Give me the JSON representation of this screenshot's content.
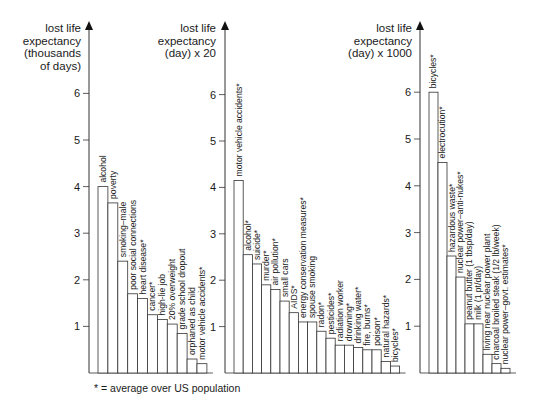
{
  "footnote": "* = average over US population",
  "chart_data": [
    {
      "type": "bar",
      "title": "",
      "ylabel": [
        "lost life",
        "expectancy",
        "(thousands",
        "of days)"
      ],
      "yticks": [
        1,
        2,
        3,
        4,
        5,
        6
      ],
      "ylim": [
        0,
        7
      ],
      "grid": false,
      "categories": [
        "alcohol",
        "poverty",
        "smoking–male",
        "poor social connections",
        "heart disease*",
        "cancer*",
        "high-lie job",
        "20% overweight",
        "grade school dropout",
        "orphaned as child",
        "motor vehicle accidents*"
      ],
      "values": [
        4.0,
        3.65,
        2.4,
        1.7,
        1.6,
        1.25,
        1.15,
        1.05,
        0.85,
        0.3,
        0.2
      ]
    },
    {
      "type": "bar",
      "title": "",
      "ylabel": [
        "lost life",
        "expectancy",
        "(day) x 20"
      ],
      "yticks": [
        1,
        2,
        3,
        4,
        5,
        6
      ],
      "ylim": [
        0,
        7
      ],
      "grid": false,
      "categories": [
        "motor vehicle accidents*",
        "alcohol*",
        "suicide*",
        "murder*",
        "air pollution*",
        "small cars",
        "AIDS*",
        "energy conservation measures*",
        "spouse smoking",
        "radon*",
        "pesticides*",
        "radiation worker",
        "drowning*",
        "drinking water*",
        "fire, burns*",
        "poison*",
        "natural hazards*",
        "bicycles*"
      ],
      "values": [
        4.15,
        2.55,
        2.35,
        1.9,
        1.8,
        1.55,
        1.3,
        1.1,
        1.1,
        0.9,
        0.75,
        0.6,
        0.6,
        0.55,
        0.5,
        0.5,
        0.25,
        0.15
      ]
    },
    {
      "type": "bar",
      "title": "",
      "ylabel": [
        "lost life",
        "expectancy",
        "(day) x 1000"
      ],
      "yticks": [
        1,
        2,
        3,
        4,
        5,
        6
      ],
      "ylim": [
        0,
        7
      ],
      "grid": false,
      "categories": [
        "bicycles*",
        "electrocution*",
        "hazardous waste*",
        "nuclear power–anti-nukes*",
        "peanut butter (1 tbsp/day)",
        "milk (1 pt/day)",
        "living near nuclear power plant",
        "charcoal broiled steak (1/2 lb/week)",
        "nuclear power–govt. estimates*"
      ],
      "values": [
        6.0,
        4.5,
        2.5,
        2.05,
        1.05,
        1.05,
        0.4,
        0.2,
        0.1
      ]
    }
  ]
}
